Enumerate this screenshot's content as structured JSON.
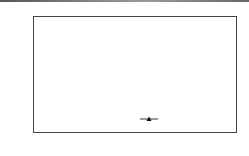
{
  "chart_data": {
    "type": "line",
    "title": "",
    "xlabel": "年",
    "ylabel": "",
    "categories": [
      "2008",
      "2009",
      "2010"
    ],
    "series": [
      {
        "name": "矿山企业数(个)",
        "values": [
          215,
          235,
          232
        ],
        "marker": "triangle",
        "color": "#333333"
      }
    ],
    "data_labels": [
      "215",
      "235",
      "232"
    ],
    "yticks": [
      "205",
      "210",
      "215",
      "220",
      "225",
      "230",
      "235",
      "240"
    ],
    "ylim": [
      205,
      240
    ],
    "grid": false,
    "legend_position": "bottom-right"
  }
}
